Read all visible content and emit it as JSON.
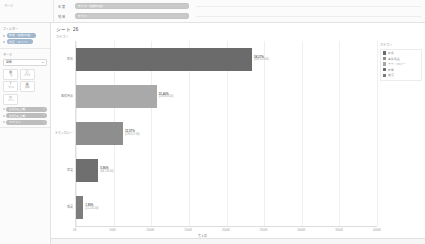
{
  "topbar": {
    "corner_label": "ページ",
    "filters": [
      {
        "name": "年 度",
        "value": "すべて（複数の値）"
      },
      {
        "name": "地 域",
        "value": "すべて"
      }
    ]
  },
  "sidebar": {
    "pages_panel": {
      "title": "ページ"
    },
    "filters_panel": {
      "title": "フィルター",
      "items": [
        {
          "label": "年度（複数の値）"
        },
        {
          "label": "地区（すべて）"
        }
      ]
    },
    "marks_panel": {
      "title": "マーク",
      "mark_type": "自動",
      "icons": [
        {
          "glyph": "▦",
          "caption": "色"
        },
        {
          "glyph": "◰",
          "caption": "サイズ"
        },
        {
          "glyph": "T",
          "caption": "ラベル"
        },
        {
          "glyph": "▣",
          "caption": "詳細"
        },
        {
          "glyph": "◎",
          "caption": "ヒント"
        }
      ],
      "pills": [
        {
          "label": "合計(売上高)"
        },
        {
          "label": "合計(売上高)"
        },
        {
          "label": "カテゴリ"
        }
      ]
    }
  },
  "sheet": {
    "title": "シート 26",
    "subtitle": "カテゴリ"
  },
  "legend": {
    "title": "カテゴリ",
    "items": [
      {
        "label": "家具",
        "color": "#6b6b6b"
      },
      {
        "label": "事務用品",
        "color": "#8e8e8e"
      },
      {
        "label": "テクノロジー",
        "color": "#a8a8a8"
      },
      {
        "label": "家電",
        "color": "#6f6f6f"
      },
      {
        "label": "雑貨",
        "color": "#7a7a7a"
      }
    ]
  },
  "chart_data": {
    "type": "bar",
    "orientation": "horizontal",
    "title": "シート 26",
    "xlabel": "売上高",
    "ylabel": "カテゴリ",
    "xlim": [
      0,
      10000
    ],
    "grid": true,
    "legend_position": "right",
    "categories": [
      "家具",
      "事務用品",
      "テクノロジー",
      "家電",
      "雑貨"
    ],
    "values": [
      6481113,
      2383816,
      1395173,
      661726,
      211241
    ],
    "percents": [
      "58.37%",
      "21.46%",
      "12.57%",
      "5.96%",
      "1.90%"
    ],
    "value_labels": [
      "(640,913.00)",
      "(238,903.00)",
      "(139,517.00)",
      "(66,726.00)",
      "(21,241.00)"
    ],
    "bar_colors": [
      "#6b6b6b",
      "#a9a9a9",
      "#8e8e8e",
      "#6f6f6f",
      "#7d7d7d"
    ],
    "bar_fractions": [
      0.585,
      0.268,
      0.156,
      0.074,
      0.024
    ],
    "xticks": [
      "0K",
      "500K",
      "1000K",
      "1500K",
      "2000K",
      "2500K",
      "3000K",
      "3500K",
      "4000K"
    ]
  }
}
